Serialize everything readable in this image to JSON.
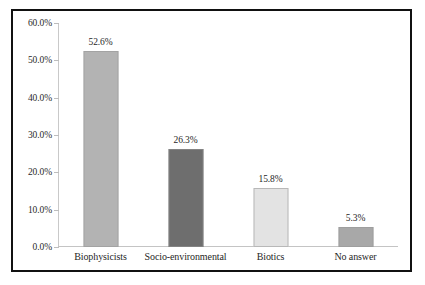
{
  "chart_data": {
    "type": "bar",
    "title": "",
    "xlabel": "",
    "ylabel": "",
    "categories": [
      "Biophysicists",
      "Socio-environmental",
      "Biotics",
      "No answer"
    ],
    "values": [
      52.6,
      26.3,
      15.8,
      5.3
    ],
    "value_labels": [
      "52.6%",
      "26.3%",
      "15.8%",
      "5.3%"
    ],
    "ylim": [
      0,
      60
    ],
    "yticks": [
      0,
      10,
      20,
      30,
      40,
      50,
      60
    ],
    "ytick_labels": [
      "0.0%",
      "10.0%",
      "20.0%",
      "30.0%",
      "40.0%",
      "50.0%",
      "60.0%"
    ],
    "grid": false,
    "legend": "none",
    "bar_colors": [
      "#b3b3b3",
      "#6e6e6e",
      "#e3e3e3",
      "#a8a8a8"
    ],
    "axis_color": "#c4c4c4",
    "frame_color": "#111111",
    "background": "#ffffff"
  }
}
